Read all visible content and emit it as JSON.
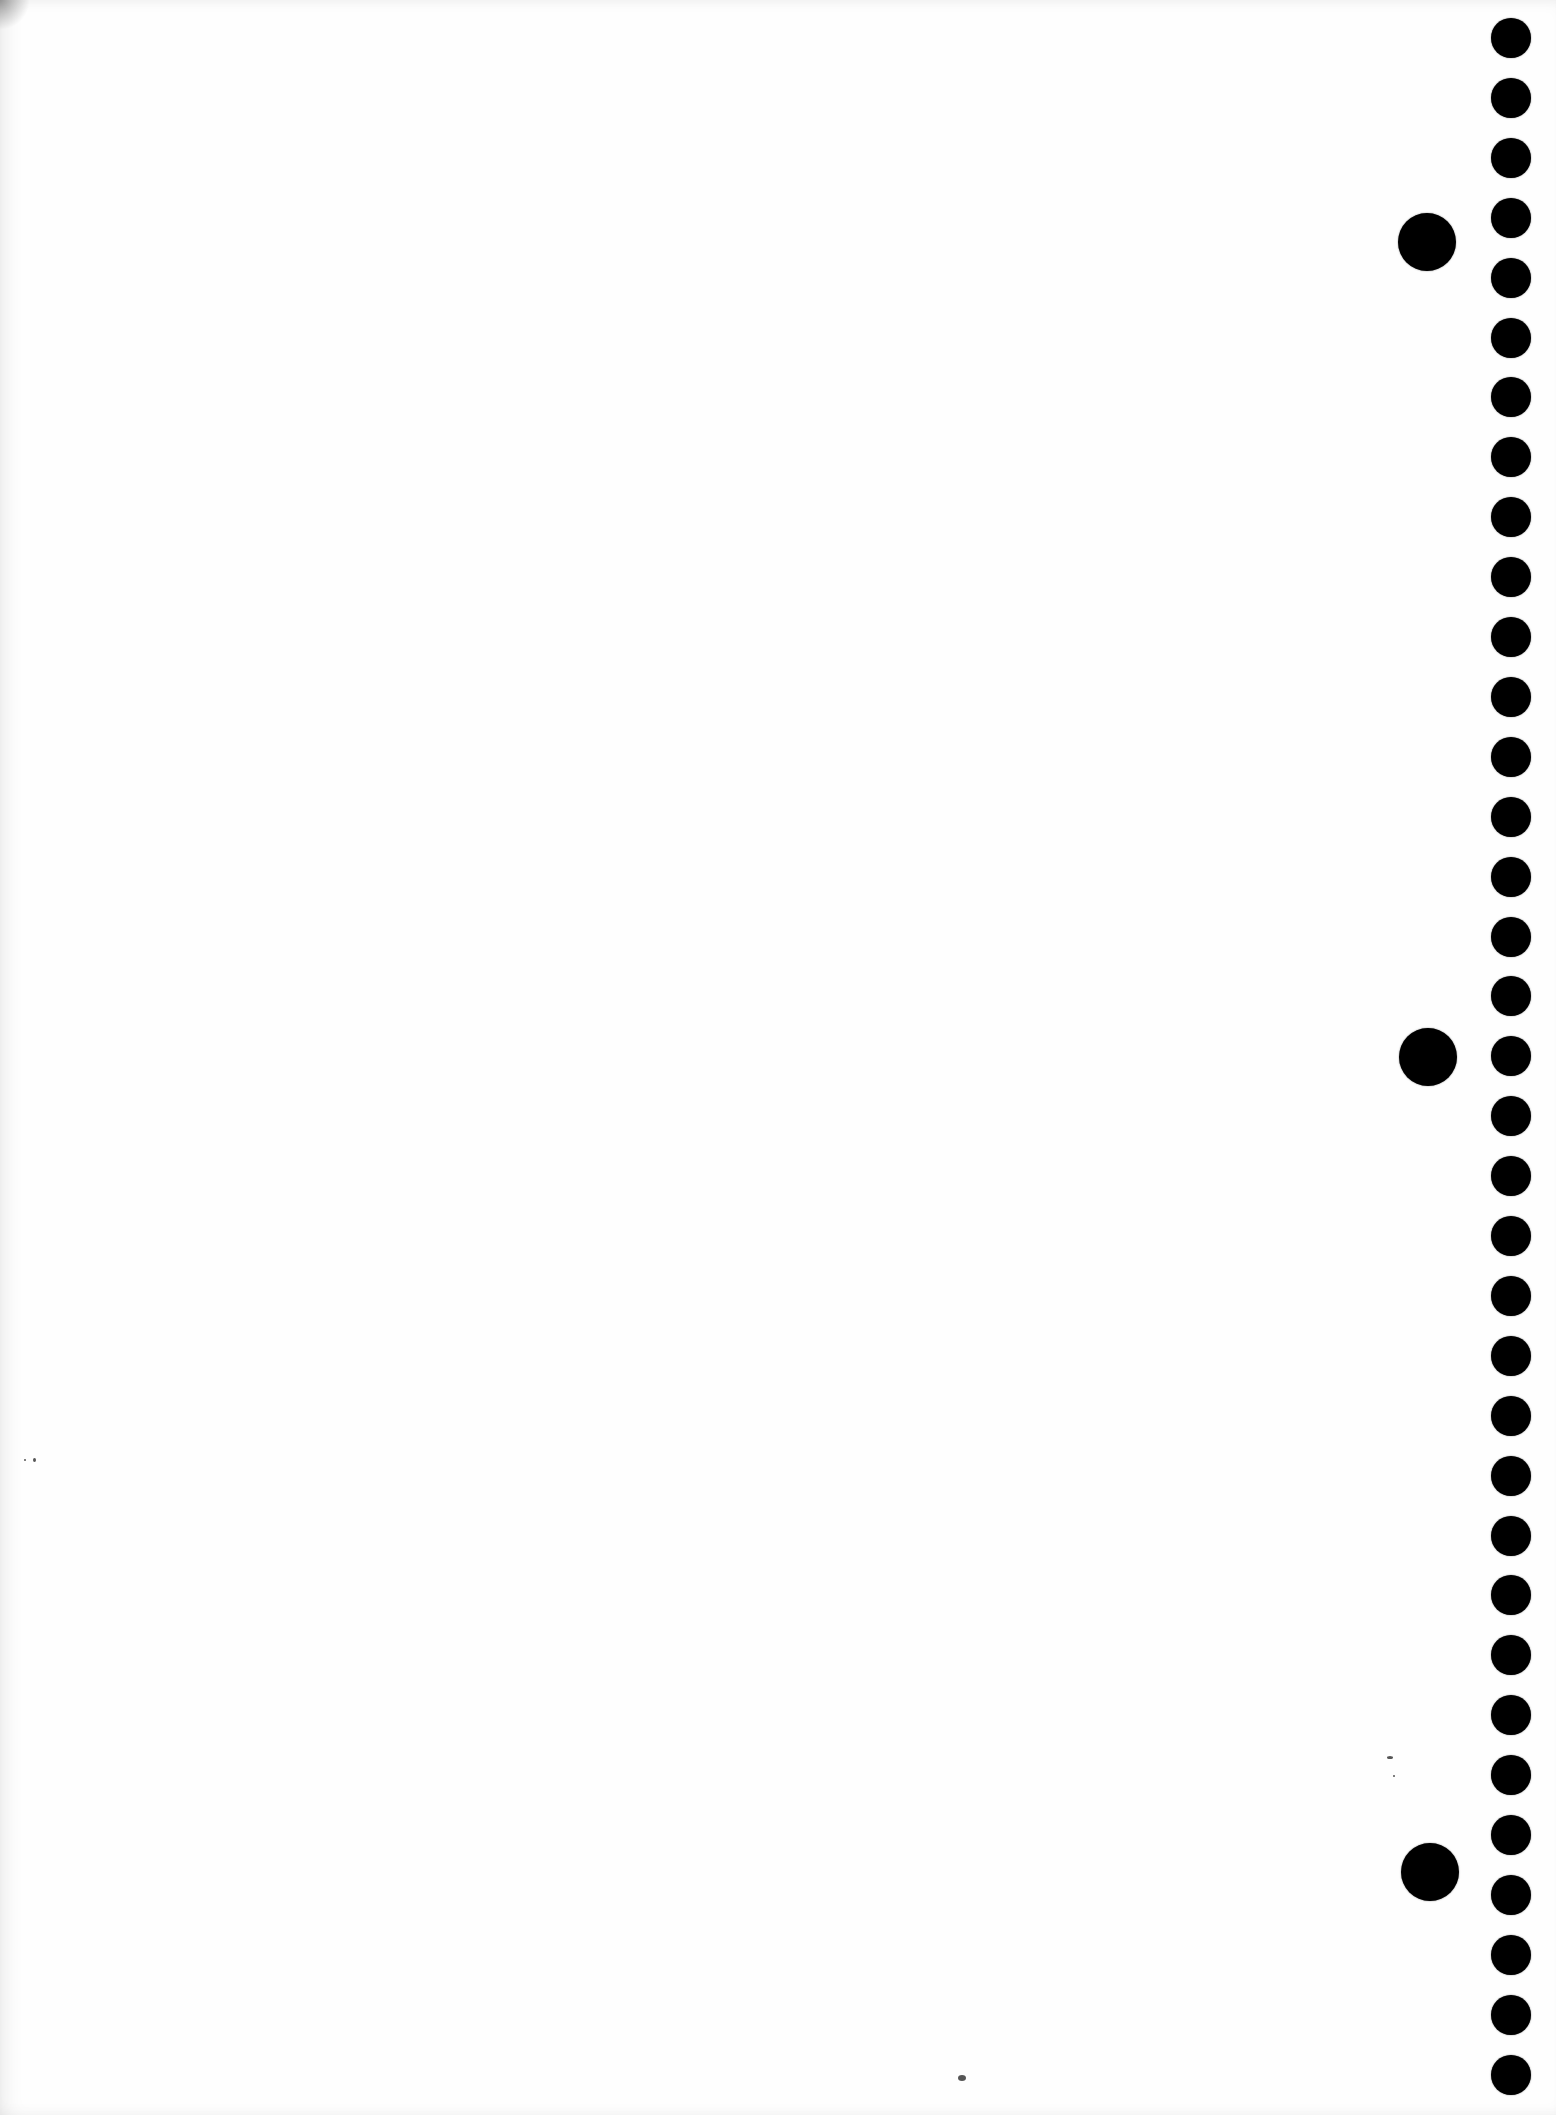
{
  "image": {
    "description": "Blank sheet of perforated paper",
    "background_color": "#fefefe",
    "hole_color": "#000000"
  },
  "perforation_column": {
    "count": 35,
    "center_x": 1511,
    "first_center_y": 38,
    "spacing": 59.9,
    "radius": 20
  },
  "binder_holes": [
    {
      "cx": 1427,
      "cy": 242,
      "r": 29
    },
    {
      "cx": 1428,
      "cy": 1057,
      "r": 29
    },
    {
      "cx": 1430,
      "cy": 1872,
      "r": 29
    }
  ],
  "specks": [
    {
      "x": 958,
      "y": 2075,
      "w": 8,
      "h": 6
    },
    {
      "x": 33,
      "y": 1458,
      "w": 3,
      "h": 4
    },
    {
      "x": 24,
      "y": 1459,
      "w": 2,
      "h": 2
    },
    {
      "x": 1387,
      "y": 1756,
      "w": 6,
      "h": 3
    },
    {
      "x": 1393,
      "y": 1775,
      "w": 2,
      "h": 2
    }
  ]
}
